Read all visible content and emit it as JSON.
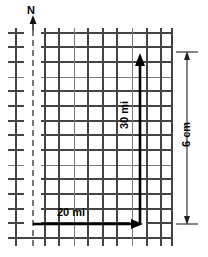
{
  "diagram": {
    "type": "map-scale-grid",
    "north_label": "N",
    "labels": {
      "horizontal_distance": "20 mi",
      "vertical_distance": "30 mi",
      "map_dimension": "6 cm"
    },
    "colors": {
      "grid_dark": "#444444",
      "grid_light": "#7a7a7a",
      "route": "#000000",
      "dimension": "#222222",
      "background": "#ffffff"
    },
    "grid": {
      "cell_size_px": 14.6,
      "columns": 9,
      "rows": 14,
      "x_start": 16,
      "x_end": 172,
      "y_start": 33,
      "y_end": 238
    },
    "meridian": {
      "x": 33,
      "style": "dashed",
      "label": "N"
    },
    "route": {
      "origin_x": 33,
      "origin_y": 224,
      "corner_x": 140,
      "top_y": 55,
      "segments": [
        {
          "name": "east-segment",
          "label": "20 mi",
          "direction": "east"
        },
        {
          "name": "north-segment",
          "label": "30 mi",
          "direction": "north"
        }
      ]
    },
    "dimension": {
      "name": "map-height",
      "label": "6 cm",
      "x": 187,
      "y_top": 52,
      "y_bottom": 224
    }
  }
}
